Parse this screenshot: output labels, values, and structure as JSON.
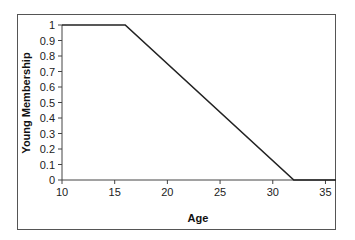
{
  "chart_data": {
    "type": "line",
    "title": "",
    "xlabel": "Age",
    "ylabel": "Young Membership",
    "xlim": [
      10,
      36
    ],
    "ylim": [
      0,
      1
    ],
    "x_ticks": [
      "10",
      "15",
      "20",
      "25",
      "30",
      "35"
    ],
    "y_ticks": [
      "0",
      "0.1",
      "0.2",
      "0.3",
      "0.4",
      "0.5",
      "0.6",
      "0.7",
      "0.8",
      "0.9",
      "1"
    ],
    "grid": false,
    "legend": null,
    "series": [
      {
        "name": "Young Membership",
        "x": [
          10,
          16,
          32,
          36
        ],
        "y": [
          1,
          1,
          0,
          0
        ],
        "color": "#222222"
      }
    ]
  }
}
